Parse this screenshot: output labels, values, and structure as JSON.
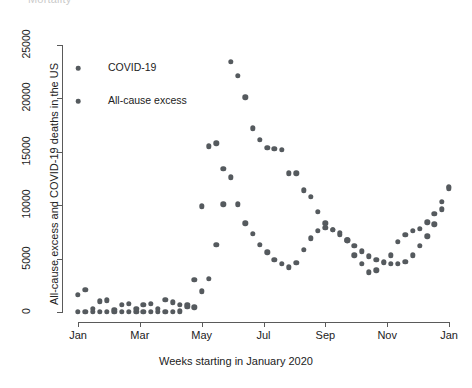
{
  "top_sliver_text": "Mortality",
  "chart_data": {
    "type": "scatter",
    "title": "",
    "xlabel": "Weeks starting in January 2020",
    "ylabel": "All-cause excess and COVID-19 deaths in the US",
    "grid": false,
    "legend_position": "top-left-inside",
    "xlim": [
      0,
      53
    ],
    "ylim": [
      0,
      25000
    ],
    "ytick_values": [
      0,
      5000,
      10000,
      15000,
      20000,
      25000
    ],
    "ytick_labels": [
      "0",
      "5000",
      "10000",
      "15000",
      "20000",
      "25000"
    ],
    "xtick_positions": [
      0,
      8.7,
      17.4,
      26.1,
      34.8,
      43.5,
      52.2
    ],
    "xtick_labels": [
      "Jan",
      "Mar",
      "May",
      "Jul",
      "Sep",
      "Nov",
      "Jan"
    ],
    "marker": "filled-circle",
    "marker_color": "#555a5e",
    "series": [
      {
        "name": "COVID-19",
        "legend_label": "COVID-19",
        "color": "#555a5e",
        "x": [
          1,
          2,
          3,
          4,
          5,
          6,
          7,
          8,
          9,
          10,
          11,
          12,
          13,
          14,
          15,
          16,
          17,
          18,
          19,
          20,
          21,
          22,
          23,
          24,
          25,
          26,
          27,
          28,
          29,
          30,
          31,
          32,
          33,
          34,
          35,
          36,
          37,
          38,
          39,
          40,
          41,
          42,
          43,
          44,
          45,
          46,
          47,
          48,
          49,
          50,
          51,
          52
        ],
        "values": [
          0,
          0,
          0,
          0,
          0,
          0,
          0,
          0,
          0,
          0,
          0,
          0,
          0,
          0,
          0,
          0,
          0,
          0,
          0,
          0,
          0,
          0,
          0,
          0,
          0,
          0,
          0,
          0,
          0,
          0,
          0,
          0,
          0,
          0,
          0,
          0,
          0,
          0,
          0,
          0,
          0,
          0,
          0,
          0,
          0,
          0,
          0,
          0,
          0,
          0,
          0,
          0
        ]
      },
      {
        "name": "All-cause excess",
        "legend_label": "All-cause excess",
        "color": "#555a5e",
        "x": [
          1,
          2,
          3,
          4,
          5,
          6,
          7,
          8,
          9,
          10,
          11,
          12,
          13,
          14,
          15,
          16,
          17,
          18,
          19,
          20,
          21,
          22,
          23,
          24,
          25,
          26,
          27,
          28,
          29,
          30,
          31,
          32,
          33,
          34,
          35,
          36,
          37,
          38,
          39,
          40,
          41,
          42,
          43,
          44,
          45,
          46,
          47,
          48,
          49,
          50,
          51,
          52
        ],
        "values": [
          1600,
          2100,
          300,
          1000,
          1100,
          200,
          700,
          750,
          300,
          700,
          750,
          300,
          1150,
          900,
          700,
          650,
          450,
          1950,
          3100,
          6300,
          10100,
          23400,
          18600,
          17000,
          15400,
          16100,
          17200,
          15300,
          15200,
          13000,
          13000,
          11400,
          10800,
          9400,
          8300,
          7700,
          7400,
          6700,
          5300,
          4500,
          3700,
          3900,
          4700,
          5300,
          6600,
          7200,
          7600,
          7800,
          8400,
          9200,
          10300,
          11700
        ]
      }
    ],
    "points": {
      "covid": [
        {
          "x": 1,
          "y": 0
        },
        {
          "x": 2,
          "y": 0
        },
        {
          "x": 3,
          "y": 0
        },
        {
          "x": 4,
          "y": 0
        },
        {
          "x": 5,
          "y": 0
        },
        {
          "x": 6,
          "y": 0
        },
        {
          "x": 7,
          "y": 0
        },
        {
          "x": 8,
          "y": 0
        },
        {
          "x": 9,
          "y": 0
        },
        {
          "x": 10,
          "y": 0
        },
        {
          "x": 11,
          "y": 0
        },
        {
          "x": 12,
          "y": 0
        },
        {
          "x": 13,
          "y": 0
        },
        {
          "x": 14,
          "y": 0
        },
        {
          "x": 15,
          "y": 60
        },
        {
          "x": 16,
          "y": 500
        },
        {
          "x": 17,
          "y": 3000
        },
        {
          "x": 18,
          "y": 9900
        },
        {
          "x": 19,
          "y": 15500
        },
        {
          "x": 20,
          "y": 15800
        },
        {
          "x": 21,
          "y": 13400
        },
        {
          "x": 22,
          "y": 12600
        },
        {
          "x": 23,
          "y": 10100
        },
        {
          "x": 24,
          "y": 8300
        },
        {
          "x": 25,
          "y": 7300
        },
        {
          "x": 26,
          "y": 6300
        },
        {
          "x": 27,
          "y": 5600
        },
        {
          "x": 28,
          "y": 4900
        },
        {
          "x": 29,
          "y": 4500
        },
        {
          "x": 30,
          "y": 4200
        },
        {
          "x": 31,
          "y": 4600
        },
        {
          "x": 32,
          "y": 5800
        },
        {
          "x": 33,
          "y": 6900
        },
        {
          "x": 34,
          "y": 7600
        },
        {
          "x": 35,
          "y": 7900
        },
        {
          "x": 36,
          "y": 7700
        },
        {
          "x": 37,
          "y": 7200
        },
        {
          "x": 38,
          "y": 6700
        },
        {
          "x": 39,
          "y": 6200
        },
        {
          "x": 40,
          "y": 5700
        },
        {
          "x": 41,
          "y": 5200
        },
        {
          "x": 42,
          "y": 4900
        },
        {
          "x": 43,
          "y": 4600
        },
        {
          "x": 44,
          "y": 4500
        },
        {
          "x": 45,
          "y": 4500
        },
        {
          "x": 46,
          "y": 4700
        },
        {
          "x": 47,
          "y": 5300
        },
        {
          "x": 48,
          "y": 6200
        },
        {
          "x": 49,
          "y": 7100
        },
        {
          "x": 50,
          "y": 8200
        },
        {
          "x": 51,
          "y": 9600
        },
        {
          "x": 52,
          "y": 11600
        }
      ],
      "excess": [
        {
          "x": 1,
          "y": 1600
        },
        {
          "x": 2,
          "y": 2100
        },
        {
          "x": 3,
          "y": 300
        },
        {
          "x": 4,
          "y": 1000
        },
        {
          "x": 5,
          "y": 1100
        },
        {
          "x": 6,
          "y": 200
        },
        {
          "x": 7,
          "y": 700
        },
        {
          "x": 8,
          "y": 750
        },
        {
          "x": 9,
          "y": 300
        },
        {
          "x": 10,
          "y": 700
        },
        {
          "x": 11,
          "y": 750
        },
        {
          "x": 12,
          "y": 300
        },
        {
          "x": 13,
          "y": 1150
        },
        {
          "x": 14,
          "y": 900
        },
        {
          "x": 15,
          "y": 700
        },
        {
          "x": 16,
          "y": 650
        },
        {
          "x": 17,
          "y": 450
        },
        {
          "x": 18,
          "y": 1950
        },
        {
          "x": 19,
          "y": 3100
        },
        {
          "x": 20,
          "y": 6300
        },
        {
          "x": 21,
          "y": 10100
        },
        {
          "x": 22,
          "y": 23400
        },
        {
          "x": 23,
          "y": 22100
        },
        {
          "x": 24,
          "y": 20100
        },
        {
          "x": 25,
          "y": 17200
        },
        {
          "x": 26,
          "y": 16100
        },
        {
          "x": 27,
          "y": 15400
        },
        {
          "x": 28,
          "y": 15300
        },
        {
          "x": 29,
          "y": 15200
        },
        {
          "x": 30,
          "y": 13000
        },
        {
          "x": 31,
          "y": 13000
        },
        {
          "x": 32,
          "y": 11400
        },
        {
          "x": 33,
          "y": 10800
        },
        {
          "x": 34,
          "y": 9400
        },
        {
          "x": 35,
          "y": 8300
        },
        {
          "x": 36,
          "y": 7700
        },
        {
          "x": 37,
          "y": 7400
        },
        {
          "x": 38,
          "y": 6700
        },
        {
          "x": 39,
          "y": 5300
        },
        {
          "x": 40,
          "y": 4500
        },
        {
          "x": 41,
          "y": 3700
        },
        {
          "x": 42,
          "y": 3900
        },
        {
          "x": 43,
          "y": 4700
        },
        {
          "x": 44,
          "y": 5300
        },
        {
          "x": 45,
          "y": 6600
        },
        {
          "x": 46,
          "y": 7200
        },
        {
          "x": 47,
          "y": 7600
        },
        {
          "x": 48,
          "y": 7800
        },
        {
          "x": 49,
          "y": 8400
        },
        {
          "x": 50,
          "y": 9200
        },
        {
          "x": 51,
          "y": 10300
        },
        {
          "x": 52,
          "y": 11700
        }
      ]
    },
    "all_points": [
      {
        "x": 1,
        "y": 0
      },
      {
        "x": 2,
        "y": 0
      },
      {
        "x": 3,
        "y": 0
      },
      {
        "x": 4,
        "y": 0
      },
      {
        "x": 5,
        "y": 0
      },
      {
        "x": 6,
        "y": 0
      },
      {
        "x": 7,
        "y": 0
      },
      {
        "x": 8,
        "y": 0
      },
      {
        "x": 9,
        "y": 0
      },
      {
        "x": 10,
        "y": 0
      },
      {
        "x": 11,
        "y": 0
      },
      {
        "x": 12,
        "y": 0
      },
      {
        "x": 13,
        "y": 0
      },
      {
        "x": 14,
        "y": 0
      },
      {
        "x": 15,
        "y": 60
      },
      {
        "x": 16,
        "y": 500
      },
      {
        "x": 17,
        "y": 3000
      },
      {
        "x": 1,
        "y": 1600
      },
      {
        "x": 2,
        "y": 2100
      },
      {
        "x": 3,
        "y": 300
      },
      {
        "x": 4,
        "y": 1000
      },
      {
        "x": 5,
        "y": 1100
      },
      {
        "x": 6,
        "y": 200
      },
      {
        "x": 7,
        "y": 700
      },
      {
        "x": 8,
        "y": 750
      },
      {
        "x": 9,
        "y": 300
      },
      {
        "x": 10,
        "y": 700
      },
      {
        "x": 11,
        "y": 750
      },
      {
        "x": 12,
        "y": 300
      },
      {
        "x": 13,
        "y": 1150
      },
      {
        "x": 14,
        "y": 900
      },
      {
        "x": 15,
        "y": 700
      },
      {
        "x": 16,
        "y": 650
      },
      {
        "x": 17,
        "y": 450
      },
      {
        "x": 18,
        "y": 1950
      },
      {
        "x": 19,
        "y": 3100
      },
      {
        "x": 20,
        "y": 6300
      }
    ]
  },
  "legend": {
    "items": [
      {
        "label": "COVID-19"
      },
      {
        "label": "All-cause excess"
      }
    ]
  },
  "axes": {
    "x_title": "Weeks starting in January 2020",
    "y_title": "All-cause excess and COVID-19 deaths in the US"
  }
}
